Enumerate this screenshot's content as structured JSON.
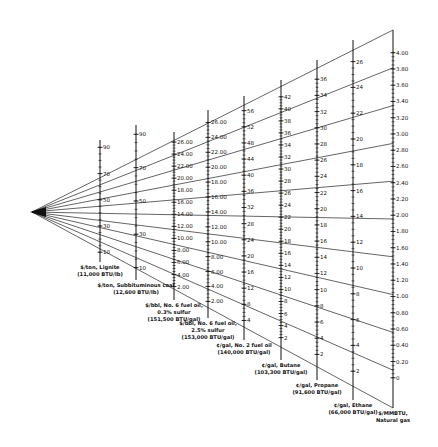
{
  "chart_data": {
    "type": "nomograph",
    "title": "",
    "pivot": {
      "x": 32,
      "y": 212
    },
    "scales": [
      {
        "name": "lignite",
        "x": 100,
        "label": "$/ton, Lignite",
        "sub": "(11,000 BTU/lb)",
        "ticks": [
          "90",
          "70",
          "50",
          "30",
          "10"
        ],
        "top": 140,
        "bottom": 262
      },
      {
        "name": "subbituminous",
        "x": 136,
        "label": "$/ton, Subbituminous coal",
        "sub": "(12,600 BTU/lb)",
        "ticks": [
          "90",
          "70",
          "50",
          "30",
          "10"
        ],
        "top": 125,
        "bottom": 280
      },
      {
        "name": "fuel-oil-6-low",
        "x": 174,
        "label": "$/bbl, No. 6 fuel oil,",
        "label2": "0.3% sulfur",
        "sub": "(151,500 BTU/gal)",
        "ticks": [
          "26.00",
          "24.00",
          "22.00",
          "20.00",
          "18.00",
          "16.00",
          "14.00",
          "12.00",
          "10.00",
          "8.00",
          "6.00",
          "4.00",
          "2.00"
        ],
        "top": 132,
        "bottom": 300
      },
      {
        "name": "fuel-oil-6-high",
        "x": 208,
        "label": "$/bbl, No. 6 fuel oil,",
        "label2": "2.5% sulfur",
        "sub": "(153,000 BTU/gal)",
        "ticks": [
          "26.00",
          "24.00",
          "22.00",
          "20.00",
          "18.00",
          "16.00",
          "14.00",
          "12.00",
          "10.00",
          "8.00",
          "6.00",
          "4.00",
          "2.00"
        ],
        "top": 110,
        "bottom": 318
      },
      {
        "name": "fuel-oil-2",
        "x": 244,
        "label": "¢/gal, No. 2 fuel oil",
        "sub": "(140,000 BTU/gal)",
        "ticks": [
          "56",
          "52",
          "48",
          "44",
          "40",
          "36",
          "32",
          "28",
          "24",
          "20",
          "16",
          "12",
          "8",
          "4"
        ],
        "top": 96,
        "bottom": 340
      },
      {
        "name": "butane",
        "x": 281,
        "label": "¢/gal, Butane",
        "sub": "(103,300 BTU/gal)",
        "ticks": [
          "42",
          "40",
          "38",
          "36",
          "34",
          "32",
          "30",
          "28",
          "26",
          "24",
          "22",
          "20",
          "18",
          "16",
          "14",
          "12",
          "10",
          "8",
          "6",
          "4",
          "2"
        ],
        "top": 80,
        "bottom": 360
      },
      {
        "name": "propane",
        "x": 317,
        "label": "¢/gal, Propane",
        "sub": "(91,600 BTU/gal)",
        "ticks": [
          "36",
          "34",
          "32",
          "30",
          "28",
          "26",
          "24",
          "22",
          "20",
          "18",
          "16",
          "14",
          "12",
          "10",
          "8",
          "6",
          "4",
          "2"
        ],
        "top": 60,
        "bottom": 380
      },
      {
        "name": "ethane",
        "x": 353,
        "label": "¢/gal, Ethane",
        "sub": "(66,000 BTU/gal)",
        "ticks": [
          "26",
          "24",
          "22",
          "20",
          "18",
          "16",
          "14",
          "12",
          "10",
          "8",
          "6",
          "4",
          "2"
        ],
        "top": 40,
        "bottom": 400
      },
      {
        "name": "natural-gas",
        "x": 393,
        "label": "$/MMBTU,",
        "sub": "Natural gas",
        "ticks": [
          "4.00",
          "3.80",
          "3.60",
          "3.40",
          "3.20",
          "3.00",
          "2.80",
          "2.60",
          "2.40",
          "2.20",
          "2.00",
          "1.80",
          "1.60",
          "1.40",
          "1.20",
          "1.00",
          "0.80",
          "0.60",
          "0.40",
          "0.20",
          "0"
        ],
        "top": 30,
        "bottom": 408
      }
    ],
    "rays_to_natural_gas": [
      "4.00",
      "3.60",
      "3.20",
      "2.80",
      "2.40",
      "2.00",
      "1.60",
      "1.20",
      "0.80",
      "0.40",
      "0"
    ]
  }
}
